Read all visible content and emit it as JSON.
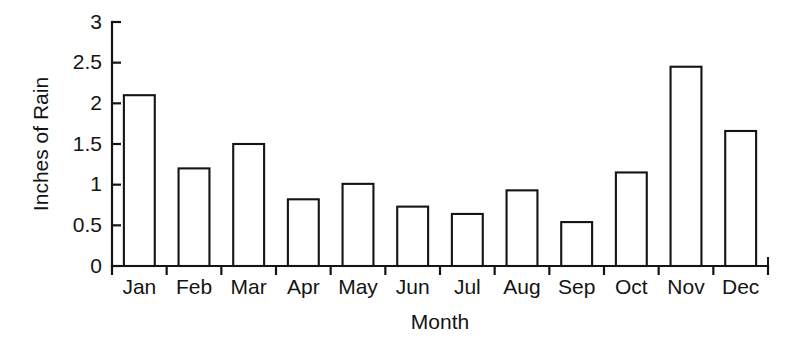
{
  "chart_data": {
    "type": "bar",
    "title": "",
    "xlabel": "Month",
    "ylabel": "Inches of Rain",
    "categories": [
      "Jan",
      "Feb",
      "Mar",
      "Apr",
      "May",
      "Jun",
      "Jul",
      "Aug",
      "Sep",
      "Oct",
      "Nov",
      "Dec"
    ],
    "values": [
      2.1,
      1.2,
      1.5,
      0.82,
      1.01,
      0.73,
      0.64,
      0.93,
      0.54,
      1.15,
      2.45,
      1.66
    ],
    "ylim": [
      0,
      3
    ],
    "ytick_labels": [
      "0",
      "0.5",
      "1",
      "1.5",
      "2",
      "2.5",
      "3"
    ],
    "ytick_values": [
      0,
      0.5,
      1,
      1.5,
      2,
      2.5,
      3
    ],
    "grid": false,
    "legend": false,
    "bar_fill_color": "#ffffff",
    "bar_edge_color": "#141414",
    "axis_color": "#141414",
    "background_color": "#ffffff"
  }
}
